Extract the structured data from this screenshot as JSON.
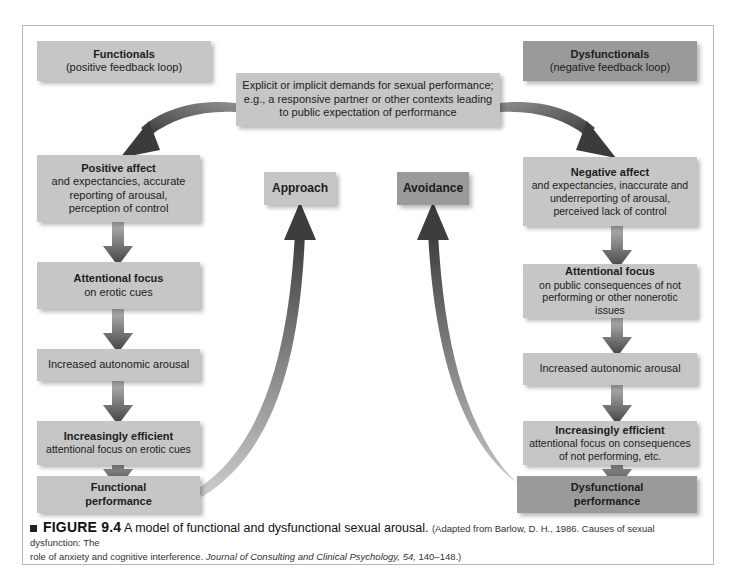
{
  "figure": {
    "caption_marker": "■",
    "caption_label": "FIGURE 9.4",
    "caption_title": "A model of functional and dysfunctional sexual arousal.",
    "caption_source_1": "(Adapted from Barlow, D. H., 1986. Causes of sexual dysfunction: The",
    "caption_source_2_pre": "role of anxiety and cognitive interference. ",
    "caption_source_2_italic": "Journal of Consulting and Clinical Psychology, 54,",
    "caption_source_2_post": " 140–148.)"
  },
  "colors": {
    "box_light": "#c6c6c6",
    "box_dark": "#9a9a9a",
    "arrow_dark": "#4a4a4a",
    "frame_border": "#b9b9b9",
    "text": "#1c1c1c"
  },
  "headers": {
    "left": {
      "title": "Functionals",
      "subtitle": "(positive feedback loop)"
    },
    "right": {
      "title": "Dysfunctionals",
      "subtitle": "(negative feedback loop)"
    }
  },
  "trigger": {
    "line1": "Explicit or implicit demands for sexual performance;",
    "line2": "e.g., a responsive partner or other contexts leading",
    "line3": "to public expectation of performance"
  },
  "center": {
    "approach": "Approach",
    "avoidance": "Avoidance"
  },
  "left_chain": [
    {
      "title": "Positive affect",
      "lines": [
        "and expectancies, accurate",
        "reporting of arousal,",
        "perception of control"
      ]
    },
    {
      "title": "Attentional focus",
      "lines": [
        "on erotic cues"
      ]
    },
    {
      "title": "",
      "lines": [
        "Increased autonomic arousal"
      ]
    },
    {
      "title": "Increasingly efficient",
      "lines": [
        "attentional focus on erotic cues"
      ]
    },
    {
      "title": "Functional performance",
      "lines": []
    }
  ],
  "right_chain": [
    {
      "title": "Negative affect",
      "lines": [
        "and expectancies, inaccurate and",
        "underreporting of arousal,",
        "perceived lack of control"
      ]
    },
    {
      "title": "Attentional focus",
      "lines": [
        "on public consequences of not",
        "performing or other nonerotic",
        "issues"
      ]
    },
    {
      "title": "",
      "lines": [
        "Increased autonomic arousal"
      ]
    },
    {
      "title": "Increasingly efficient",
      "lines": [
        "attentional focus on consequences",
        "of not performing, etc."
      ]
    },
    {
      "title": "Dysfunctional performance",
      "lines": []
    }
  ]
}
